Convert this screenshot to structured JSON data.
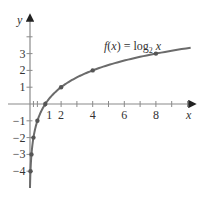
{
  "chart_data": {
    "type": "line",
    "title": "",
    "function_label": "f(x) = log₂ x",
    "function_label_parts": {
      "f": "f",
      "open": "(",
      "x": "x",
      "close": ") = log",
      "base": "2",
      "arg": " x"
    },
    "xlabel": "x",
    "ylabel": "y",
    "xlim": [
      0,
      10
    ],
    "ylim": [
      -4.5,
      4.5
    ],
    "x_ticks": [
      1,
      2,
      4,
      6,
      8
    ],
    "x_tick_labels": [
      "1",
      "2",
      "4",
      "6",
      "8"
    ],
    "y_ticks": [
      -4,
      -3,
      -2,
      -1,
      1,
      2,
      3
    ],
    "y_tick_labels": [
      "-4",
      "-3",
      "-2",
      "-1",
      "1",
      "2",
      "3"
    ],
    "points": [
      {
        "x": 0.0625,
        "y": -4
      },
      {
        "x": 0.125,
        "y": -3
      },
      {
        "x": 0.25,
        "y": -2
      },
      {
        "x": 0.5,
        "y": -1
      },
      {
        "x": 1,
        "y": 0
      },
      {
        "x": 2,
        "y": 1
      },
      {
        "x": 4,
        "y": 2
      },
      {
        "x": 8,
        "y": 3
      }
    ],
    "grid": false,
    "legend": null,
    "colors": {
      "curve": "#6b6b6b",
      "axis": "#8a8a8a",
      "text": "#333333"
    }
  }
}
